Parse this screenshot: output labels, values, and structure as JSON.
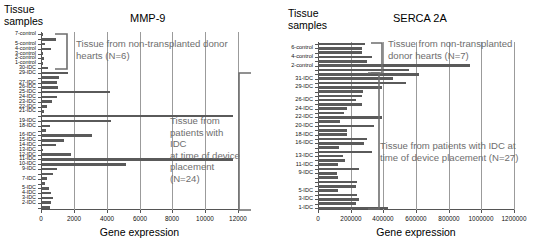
{
  "figure": {
    "width": 546,
    "height": 250,
    "bar_color": "#5a5a5a",
    "grid_color": "#9b9b9b",
    "annotation_color": "#6e6e6e"
  },
  "panels": [
    {
      "id": "mmp9",
      "axis_header": "Tissue\nsamples",
      "title": "MMP-9",
      "xlabel": "Gene expression",
      "annotation_top": "Tissue from non-transplanted donor\nhearts (N=6)",
      "annotation_bottom": "Tissue from\npatients with IDC\nat time of device\nplacement (N=24)"
    },
    {
      "id": "serca2a",
      "axis_header": "Tissue\nsamples",
      "title": "SERCA 2A",
      "xlabel": "Gene expression",
      "annotation_top": "Tissue from non-transplanted\ndonor hearts (N=7)",
      "annotation_bottom": "Tissue from patients with IDC at\ntime of device placement (N=27)"
    }
  ],
  "chart_data": [
    {
      "type": "bar",
      "orientation": "horizontal",
      "id": "mmp9",
      "title": "MMP-9",
      "xlabel": "Gene expression",
      "ylabel": "Tissue samples",
      "xlim": [
        0,
        12000
      ],
      "xticks": [
        0,
        2000,
        4000,
        6000,
        8000,
        10000,
        12000
      ],
      "xtick_labels": [
        "0",
        "2000",
        "4000",
        "6000",
        "8000",
        "10000",
        "12000"
      ],
      "grid": true,
      "legend": "none",
      "categories": [
        "7-control",
        "6-control",
        "5-control",
        "4-control",
        "3-control",
        "2-control",
        "1-control",
        "30-IDC",
        "29-IDC",
        "28-IDC",
        "27-IDC",
        "26-IDC",
        "25-IDC",
        "24-IDC",
        "23-IDC",
        "22-IDC",
        "21-IDC",
        "20-IDC",
        "19-IDC",
        "18-IDC",
        "17-IDC",
        "16-IDC",
        "15-IDC",
        "14-IDC",
        "13-IDC",
        "12-IDC",
        "11-IDC",
        "10-IDC",
        "9-IDC",
        "8-IDC",
        "7-IDC",
        "6-IDC",
        "5-IDC",
        "4-IDC",
        "3-IDC",
        "2-IDC",
        "1-IDC"
      ],
      "tick_labels_shown": [
        "7-control",
        "5-control",
        "4-control",
        "3-control",
        "2-control",
        "1-control",
        "30-IDC",
        "29-IDC",
        "27-IDC",
        "26-IDC",
        "25-IDC",
        "24-IDC",
        "23-IDC",
        "22-IDC",
        "21-IDC",
        "19-IDC",
        "18-IDC",
        "16-IDC",
        "15-IDC",
        "14-IDC",
        "13-IDC",
        "12-IDC",
        "11-IDC",
        "10-IDC",
        "9-IDC",
        "7-IDC",
        "5-IDC",
        "4-IDC",
        "3-IDC",
        "2-IDC"
      ],
      "values": [
        140,
        900,
        220,
        620,
        130,
        160,
        110,
        420,
        1640,
        1120,
        980,
        1050,
        4200,
        1000,
        700,
        360,
        200,
        11700,
        4250,
        560,
        300,
        3100,
        1400,
        900,
        140,
        1800,
        11700,
        5200,
        950,
        720,
        380,
        240,
        500,
        580,
        760,
        620,
        520
      ],
      "annotations": [
        {
          "text": "Tissue from non-transplanted donor hearts (N=6)",
          "group": "control"
        },
        {
          "text": "Tissue from patients with IDC at time of device placement (N=24)",
          "group": "idc"
        }
      ]
    },
    {
      "type": "bar",
      "orientation": "horizontal",
      "id": "serca2a",
      "title": "SERCA 2A",
      "xlabel": "Gene expression",
      "ylabel": "Tissue samples",
      "xlim": [
        0,
        1200000
      ],
      "xticks": [
        0,
        200000,
        400000,
        600000,
        800000,
        1000000,
        1200000
      ],
      "xtick_labels": [
        "0",
        "200000",
        "400000",
        "600000",
        "800000",
        "1000000",
        "1200000"
      ],
      "grid": true,
      "legend": "none",
      "categories": [
        "7-control",
        "6-control",
        "5-control",
        "4-control",
        "3-control",
        "2-control",
        "1-control",
        "32-IDC",
        "31-IDC",
        "30-IDC",
        "29-IDC",
        "28-IDC",
        "27-IDC",
        "26-IDC",
        "25-IDC",
        "24-IDC",
        "23-IDC",
        "22-IDC",
        "21-IDC",
        "20-IDC",
        "19-IDC",
        "18-IDC",
        "17-IDC",
        "16-IDC",
        "15-IDC",
        "14-IDC",
        "13-IDC",
        "12-IDC",
        "11-IDC",
        "10-IDC",
        "9-IDC",
        "8-IDC",
        "7-IDC",
        "6-IDC",
        "5-IDC",
        "4-IDC",
        "3-IDC",
        "2-IDC",
        "1-IDC"
      ],
      "tick_labels_shown": [
        "6-control",
        "4-control",
        "2-control",
        "31-IDC",
        "29-IDC",
        "26-IDC",
        "24-IDC",
        "22-IDC",
        "20-IDC",
        "18-IDC",
        "16-IDC",
        "13-IDC",
        "11-IDC",
        "9-IDC",
        "5-IDC",
        "3-IDC",
        "1-IDC"
      ],
      "values": [
        290000,
        270000,
        270000,
        330000,
        300000,
        930000,
        560000,
        620000,
        460000,
        540000,
        390000,
        275000,
        270000,
        230000,
        270000,
        175000,
        160000,
        390000,
        135000,
        345000,
        180000,
        175000,
        300000,
        280000,
        130000,
        330000,
        150000,
        165000,
        120000,
        250000,
        115000,
        120000,
        240000,
        230000,
        125000,
        240000,
        250000,
        230000,
        430000
      ],
      "annotations": [
        {
          "text": "Tissue from non-transplanted donor hearts (N=7)",
          "group": "control"
        },
        {
          "text": "Tissue from patients with IDC at time of device placement (N=27)",
          "group": "idc"
        }
      ]
    }
  ]
}
